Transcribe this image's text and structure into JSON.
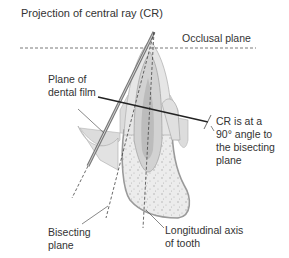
{
  "title": "Projection of central ray (CR)",
  "labels": {
    "occlusal_plane": "Occlusal plane",
    "film_line1": "Plane of",
    "film_line2": "dental film",
    "cr_line1": "CR is at a",
    "cr_line2": "90° angle to",
    "cr_line3": "the bisecting",
    "cr_line4": "plane",
    "bisect_line1": "Bisecting",
    "bisect_line2": "plane",
    "axis_line1": "Longitudinal axis",
    "axis_line2": "of tooth"
  },
  "colors": {
    "line": "#555555",
    "ray": "#222222",
    "enamel": "#e6e6e6",
    "dentin": "#d2d2d2",
    "pulp": "#b8b8b8",
    "bone": "#ececec",
    "bone_edge": "#9a9a9a",
    "gum": "#dcdcdc",
    "text": "#333333"
  }
}
